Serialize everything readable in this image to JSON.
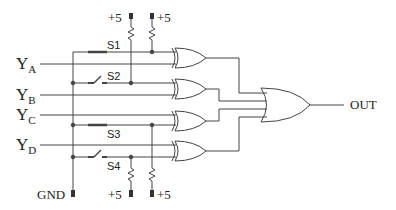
{
  "diagram": {
    "type": "logic-circuit",
    "inputs": [
      {
        "letter": "Y",
        "sub": "A"
      },
      {
        "letter": "Y",
        "sub": "B"
      },
      {
        "letter": "Y",
        "sub": "C"
      },
      {
        "letter": "Y",
        "sub": "D"
      }
    ],
    "switches": [
      {
        "label": "S1",
        "state": "closed"
      },
      {
        "label": "S2",
        "state": "open"
      },
      {
        "label": "S3",
        "state": "closed"
      },
      {
        "label": "S4",
        "state": "open"
      }
    ],
    "supplies": {
      "top_left": "+5",
      "top_right": "+5",
      "bottom_left": "+5",
      "bottom_right": "+5",
      "ground": "GND"
    },
    "gates": {
      "xor_count": 4,
      "or_count": 1
    },
    "output": "OUT",
    "colors": {
      "line": "#444444",
      "text": "#222222",
      "background": "#ffffff"
    }
  }
}
